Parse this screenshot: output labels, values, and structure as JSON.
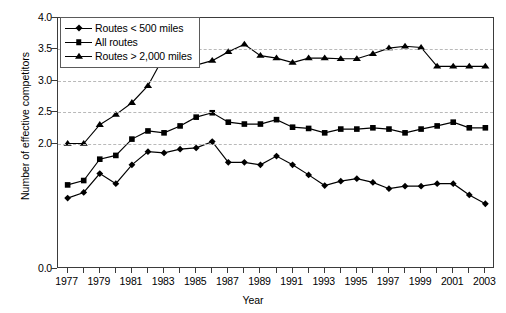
{
  "chart_data": {
    "type": "line",
    "title": "",
    "xlabel": "Year",
    "ylabel": "Number of effective competitors",
    "xlim": [
      1976.4,
      2003.6
    ],
    "ylim": [
      0.0,
      4.0
    ],
    "grid": true,
    "grid_axis": "y",
    "legend_position": "upper left",
    "ytick_labels": [
      "0.0",
      "2.0",
      "2.5",
      "3.0",
      "3.5",
      "4.0"
    ],
    "ytick_values": [
      0.0,
      2.0,
      2.5,
      3.0,
      3.5,
      4.0
    ],
    "gridline_values": [
      2.0,
      2.5,
      3.0,
      3.5
    ],
    "x": [
      1977,
      1978,
      1979,
      1980,
      1981,
      1982,
      1983,
      1984,
      1985,
      1986,
      1987,
      1988,
      1989,
      1990,
      1991,
      1992,
      1993,
      1994,
      1995,
      1996,
      1997,
      1998,
      1999,
      2000,
      2001,
      2002,
      2003
    ],
    "xtick_labels": [
      "1977",
      "1979",
      "1981",
      "1983",
      "1985",
      "1987",
      "1989",
      "1991",
      "1993",
      "1995",
      "1997",
      "1999",
      "2001",
      "2003"
    ],
    "xtick_label_values": [
      1977,
      1979,
      1981,
      1983,
      1985,
      1987,
      1989,
      1991,
      1993,
      1995,
      1997,
      1999,
      2001,
      2003
    ],
    "series": [
      {
        "name": "Routes < 500 miles",
        "marker": "diamond",
        "values": [
          1.13,
          1.22,
          1.52,
          1.36,
          1.66,
          1.87,
          1.85,
          1.91,
          1.93,
          2.03,
          1.7,
          1.7,
          1.66,
          1.8,
          1.66,
          1.5,
          1.33,
          1.4,
          1.44,
          1.38,
          1.28,
          1.32,
          1.32,
          1.36,
          1.36,
          1.18,
          1.04
        ]
      },
      {
        "name": "All routes",
        "marker": "square",
        "values": [
          1.34,
          1.41,
          1.75,
          1.81,
          2.07,
          2.2,
          2.17,
          2.28,
          2.42,
          2.49,
          2.34,
          2.31,
          2.31,
          2.38,
          2.26,
          2.24,
          2.17,
          2.23,
          2.23,
          2.25,
          2.23,
          2.17,
          2.23,
          2.28,
          2.34,
          2.25,
          2.25
        ]
      },
      {
        "name": "Routes > 2,000 miles",
        "marker": "triangle",
        "values": [
          2.0,
          2.0,
          2.3,
          2.46,
          2.65,
          2.92,
          3.39,
          3.46,
          3.25,
          3.32,
          3.46,
          3.58,
          3.4,
          3.36,
          3.29,
          3.36,
          3.36,
          3.35,
          3.35,
          3.43,
          3.52,
          3.55,
          3.53,
          3.23,
          3.23,
          3.23,
          3.23
        ]
      }
    ]
  },
  "legend": {
    "items": [
      {
        "label": "Routes < 500 miles",
        "marker": "diamond"
      },
      {
        "label": "All routes",
        "marker": "square"
      },
      {
        "label": "Routes > 2,000 miles",
        "marker": "triangle"
      }
    ]
  },
  "axes": {
    "x_title": "Year",
    "y_title": "Number of effective competitors"
  },
  "colors": {
    "series": "#000000",
    "grid": "#b9b9b9",
    "frame": "#3b3b3b",
    "background": "#ffffff"
  }
}
